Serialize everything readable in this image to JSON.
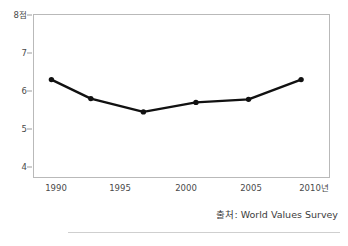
{
  "chart_data": {
    "type": "line",
    "title": "",
    "subtitle": "",
    "xlabel": "",
    "ylabel": "",
    "xlim": [
      1988.6,
      2011.2
    ],
    "ylim": [
      3.85,
      8.05
    ],
    "grid": false,
    "legend": null,
    "y_axis": {
      "ticks": [
        8,
        7,
        6,
        5,
        4
      ],
      "tick_labels": [
        "8점",
        "7",
        "6",
        "5",
        "4"
      ],
      "unit_label": "점"
    },
    "x_axis": {
      "ticks": [
        1990,
        1995,
        2000,
        2005,
        2010
      ],
      "tick_labels": [
        "1990",
        "1995",
        "2000",
        "2005",
        "2010년"
      ],
      "unit_label": "년"
    },
    "series": [
      {
        "name": "",
        "marker": "circle",
        "color": "#111111",
        "x": [
          1990,
          1993,
          1997,
          2001,
          2005,
          2009
        ],
        "values": [
          6.3,
          5.8,
          5.45,
          5.7,
          5.78,
          6.3
        ]
      }
    ],
    "points": [
      {
        "x": 1990,
        "y": 6.3
      },
      {
        "x": 1993,
        "y": 5.8
      },
      {
        "x": 1997,
        "y": 5.45
      },
      {
        "x": 2001,
        "y": 5.7
      },
      {
        "x": 2005,
        "y": 5.78
      },
      {
        "x": 2009,
        "y": 6.3
      }
    ],
    "annotations": []
  },
  "source": {
    "text": "출처: World Values Survey"
  },
  "colors": {
    "line": "#111111",
    "marker": "#111111",
    "frame": "#b9b9b9",
    "tick": "#9d9d9d",
    "text": "#3a3a3a",
    "background": "#ffffff",
    "rule": "#cfcfcf"
  }
}
